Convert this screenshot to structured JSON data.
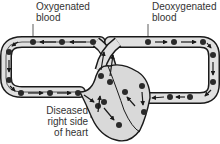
{
  "diagram": {
    "labels": {
      "oxygenated": [
        "Oxygenated",
        "blood"
      ],
      "deoxygenated": [
        "Deoxygenated",
        "blood"
      ],
      "diseased": [
        "Diseased",
        "right side",
        "of heart"
      ]
    },
    "icons": {
      "blood-cell": "dot",
      "flow-arrow": "arrowhead"
    },
    "colors": {
      "outline": "#1a1a1a",
      "vessel_fill": "#e0e0e0",
      "heart_fill": "#d9d9d9",
      "cell": "#2a2a2a",
      "text": "#333333"
    }
  }
}
